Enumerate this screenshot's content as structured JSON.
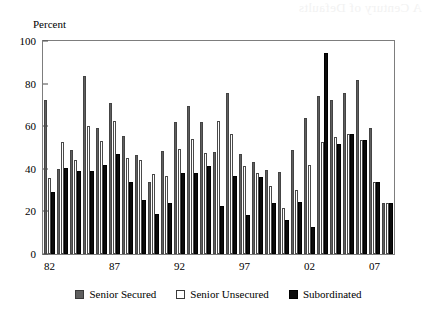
{
  "figure": {
    "axis_label_y": "Percent",
    "bleed_text": "A Century of Defaults"
  },
  "legend": {
    "position": "bottom-center",
    "entries": [
      {
        "label": "Senior Secured",
        "color": "#5f5f5f",
        "key": "senior_secured"
      },
      {
        "label": "Senior Unsecured",
        "color": "#ffffff",
        "key": "senior_unsecured"
      },
      {
        "label": "Subordinated",
        "color": "#0b0b0b",
        "key": "subordinated"
      }
    ]
  },
  "chart_data": {
    "type": "bar",
    "title": "",
    "subtitle": "",
    "xlabel": "",
    "ylabel": "Percent",
    "ylim": [
      0,
      100
    ],
    "yticks": [
      0,
      20,
      40,
      60,
      80,
      100
    ],
    "ytick_labels": [
      "0",
      "20",
      "40",
      "60",
      "80",
      "100"
    ],
    "grid": false,
    "legend_position": "bottom-center",
    "categories": [
      "82",
      "83",
      "84",
      "85",
      "86",
      "87",
      "88",
      "89",
      "90",
      "91",
      "92",
      "93",
      "94",
      "95",
      "96",
      "97",
      "98",
      "99",
      "00",
      "01",
      "02",
      "03",
      "04",
      "05",
      "06",
      "07",
      "08"
    ],
    "xtick_labels": [
      "82",
      "87",
      "92",
      "97",
      "02",
      "07"
    ],
    "xtick_categories": [
      "82",
      "87",
      "92",
      "97",
      "02",
      "07"
    ],
    "series": [
      {
        "name": "Senior Secured",
        "color": "#5f5f5f",
        "values": [
          72.5,
          40.0,
          49.0,
          83.5,
          59.0,
          71.0,
          55.5,
          46.5,
          34.0,
          48.5,
          62.0,
          69.5,
          62.0,
          48.0,
          75.5,
          47.0,
          43.0,
          39.5,
          38.5,
          49.0,
          64.0,
          74.0,
          72.5,
          75.5,
          81.5,
          59.0,
          24.0
        ]
      },
      {
        "name": "Senior Unsecured",
        "color": "#ffffff",
        "values": [
          35.5,
          52.5,
          44.0,
          60.0,
          53.0,
          62.5,
          45.0,
          44.0,
          37.5,
          36.5,
          49.5,
          54.0,
          47.5,
          62.5,
          56.5,
          41.5,
          38.0,
          32.0,
          21.5,
          30.0,
          42.0,
          52.5,
          55.0,
          56.5,
          53.5,
          34.0,
          24.0
        ]
      },
      {
        "name": "Subordinated",
        "color": "#0b0b0b",
        "values": [
          29.0,
          40.5,
          39.0,
          39.0,
          42.0,
          47.0,
          34.0,
          25.5,
          19.0,
          24.0,
          38.0,
          38.0,
          41.5,
          22.5,
          36.5,
          18.5,
          36.0,
          24.0,
          16.0,
          24.5,
          12.5,
          94.5,
          51.5,
          56.5,
          53.5,
          34.0,
          24.0
        ]
      }
    ]
  }
}
